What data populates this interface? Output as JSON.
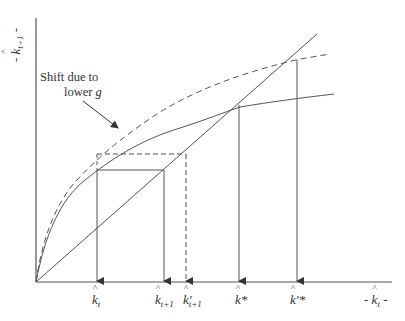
{
  "diagram": {
    "axes": {
      "y_label": {
        "prefix": "- ",
        "base": "k",
        "sub": "t+1",
        "suffix": " -"
      },
      "x_label": {
        "prefix": "- ",
        "base": "k",
        "sub": "t",
        "suffix": " -"
      }
    },
    "annotation": {
      "line1": "Shift due to",
      "line2_text": "lower ",
      "line2_var": "g"
    },
    "tick_labels": [
      {
        "id": "k_t",
        "base": "k",
        "sub": "t",
        "prime": ""
      },
      {
        "id": "k_t1",
        "base": "k",
        "sub": "t+1",
        "prime": ""
      },
      {
        "id": "k_prime_t1",
        "base": "k",
        "sub": "t+1",
        "prime": "′"
      },
      {
        "id": "k_star",
        "base": "k",
        "sub": "",
        "prime": "",
        "sup": "*"
      },
      {
        "id": "k_prime_star",
        "base": "k",
        "sub": "",
        "prime": "′",
        "sup": "*"
      }
    ],
    "curves": [
      {
        "name": "45-degree line",
        "style": "solid"
      },
      {
        "name": "original growth curve",
        "style": "solid"
      },
      {
        "name": "shifted growth curve (lower g)",
        "style": "dashed"
      }
    ],
    "colors": {
      "line": "#555555",
      "text": "#333333",
      "background": "#ffffff"
    }
  }
}
